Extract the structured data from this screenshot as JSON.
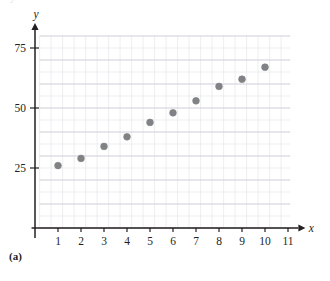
{
  "figure": {
    "panel_label": "(a)",
    "top_partial_text": "y"
  },
  "axes": {
    "x_name": "x",
    "y_name": "y",
    "x_ticks": [
      "1",
      "2",
      "3",
      "4",
      "5",
      "6",
      "7",
      "8",
      "9",
      "10",
      "11"
    ],
    "y_ticks": [
      "25",
      "50",
      "75"
    ]
  },
  "colors": {
    "point": "#808285",
    "axis": "#231f20",
    "grid_minor": "#e8e8ec",
    "grid_major": "#c9c9d2",
    "text": "#231f20"
  },
  "chart_data": {
    "type": "scatter",
    "title": "",
    "subtitle": "",
    "xlabel": "x",
    "ylabel": "y",
    "xlim": [
      0,
      11.6
    ],
    "ylim": [
      0,
      82
    ],
    "xticks": [
      1,
      2,
      3,
      4,
      5,
      6,
      7,
      8,
      9,
      10,
      11
    ],
    "yticks": [
      25,
      50,
      75
    ],
    "grid": true,
    "grid_minor_x_step": 0.5,
    "grid_minor_y_step": 5,
    "grid_major_x_step": 1,
    "grid_major_y_step": 10,
    "legend": null,
    "legend_position": "none",
    "annotations": [
      "(a)"
    ],
    "series": [
      {
        "name": "data",
        "marker": "circle",
        "color": "#808285",
        "points": [
          {
            "x": 1,
            "y": 26
          },
          {
            "x": 2,
            "y": 29
          },
          {
            "x": 3,
            "y": 34
          },
          {
            "x": 4,
            "y": 38
          },
          {
            "x": 5,
            "y": 44
          },
          {
            "x": 6,
            "y": 48
          },
          {
            "x": 7,
            "y": 53
          },
          {
            "x": 8,
            "y": 59
          },
          {
            "x": 9,
            "y": 62
          },
          {
            "x": 10,
            "y": 67
          }
        ]
      }
    ]
  }
}
